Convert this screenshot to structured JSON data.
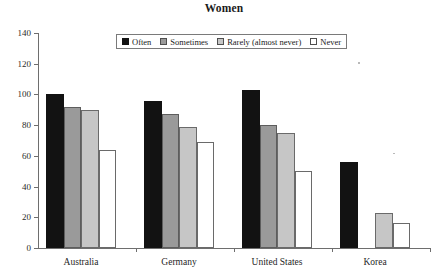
{
  "chart_data": {
    "type": "bar",
    "title": "Women",
    "xlabel": "",
    "ylabel": "",
    "ylim": [
      0,
      140
    ],
    "yticks": [
      0,
      20,
      40,
      60,
      80,
      100,
      120,
      140
    ],
    "grid": false,
    "legend_position": "top-center",
    "categories": [
      "Australia",
      "Germany",
      "United States",
      "Korea"
    ],
    "series": [
      {
        "name": "Often",
        "color": "#121212",
        "values": [
          100,
          96,
          103,
          56
        ]
      },
      {
        "name": "Sometimes",
        "color": "#9a9a9a",
        "values": [
          92,
          87,
          80,
          0
        ]
      },
      {
        "name": "Rarely (almost never)",
        "color": "#c6c6c6",
        "values": [
          90,
          79,
          75,
          23
        ]
      },
      {
        "name": "Never",
        "color": "#ffffff",
        "values": [
          64,
          69,
          50,
          16
        ]
      }
    ]
  }
}
